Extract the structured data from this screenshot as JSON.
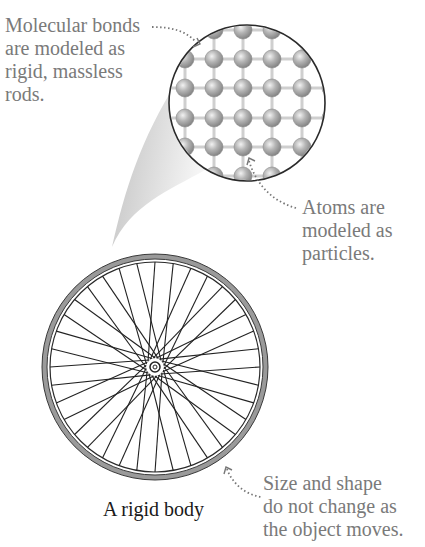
{
  "figure": {
    "caption": "A rigid body",
    "annotations": {
      "bonds": {
        "lines": [
          "Molecular bonds",
          "are modeled as",
          "rigid, massless",
          "rods."
        ]
      },
      "atoms": {
        "lines": [
          "Atoms are",
          "modeled as",
          "particles."
        ]
      },
      "shape": {
        "lines": [
          "Size and shape",
          "do not change as",
          "the object moves."
        ]
      }
    },
    "colors": {
      "annotation_text": "#7a7a7a",
      "caption_text": "#1a1a1a",
      "atom_fill": "#a8a8a8",
      "bond": "#cfcfcf",
      "tire": "#9a9a9a",
      "outline": "#2a2a2a"
    },
    "wheel": {
      "spoke_count": 36,
      "center": [
        155,
        367
      ],
      "radius": 113
    },
    "magnifier": {
      "center": [
        247,
        103
      ],
      "radius": 78,
      "lattice_spacing": 29
    }
  }
}
